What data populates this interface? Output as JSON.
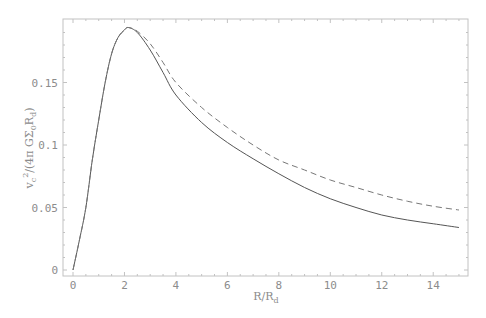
{
  "chart_data": {
    "type": "line",
    "title": "",
    "xlabel": "R/R_d",
    "ylabel": "v_c^2/(4π GΣ_0 R_d)",
    "xlim": [
      0,
      15
    ],
    "ylim": [
      0,
      0.197
    ],
    "x_ticks": [
      0,
      2,
      4,
      6,
      8,
      10,
      12,
      14
    ],
    "x_tick_labels": [
      "0",
      "2",
      "4",
      "6",
      "8",
      "10",
      "12",
      "14"
    ],
    "y_ticks": [
      0,
      0.05,
      0.1,
      0.15
    ],
    "y_tick_labels": [
      "0",
      "0.05",
      "0.1",
      "0.15"
    ],
    "grid": false,
    "legend": null,
    "series": [
      {
        "name": "solid",
        "style": "solid",
        "color": "#555555",
        "x": [
          0,
          0.25,
          0.5,
          0.75,
          1,
          1.25,
          1.5,
          1.75,
          2,
          2.15,
          2.5,
          3,
          3.5,
          4,
          5,
          6,
          7,
          8,
          9,
          10,
          11,
          12,
          13,
          14,
          15
        ],
        "y": [
          0,
          0.024,
          0.05,
          0.088,
          0.12,
          0.15,
          0.173,
          0.186,
          0.192,
          0.194,
          0.19,
          0.176,
          0.158,
          0.14,
          0.118,
          0.102,
          0.089,
          0.077,
          0.066,
          0.057,
          0.05,
          0.044,
          0.04,
          0.037,
          0.034
        ]
      },
      {
        "name": "dashed",
        "style": "dashed",
        "color": "#777777",
        "x": [
          0,
          0.25,
          0.5,
          0.75,
          1,
          1.25,
          1.5,
          1.75,
          2,
          2.15,
          2.5,
          3,
          3.5,
          4,
          5,
          6,
          7,
          8,
          9,
          10,
          11,
          12,
          13,
          14,
          15
        ],
        "y": [
          0,
          0.024,
          0.05,
          0.088,
          0.12,
          0.15,
          0.173,
          0.186,
          0.192,
          0.194,
          0.191,
          0.181,
          0.166,
          0.15,
          0.13,
          0.114,
          0.1,
          0.088,
          0.08,
          0.072,
          0.066,
          0.06,
          0.055,
          0.051,
          0.048
        ]
      }
    ]
  },
  "labels": {
    "x_axis": "R/R",
    "x_axis_sub": "d",
    "y_axis_v": "v",
    "y_axis_c": "c",
    "y_axis_sup": "2",
    "y_axis_mid": "/(4π GΣ",
    "y_axis_zero": "0",
    "y_axis_R": "R",
    "y_axis_d": "d",
    "y_axis_close": ")"
  },
  "colors": {
    "frame": "#b8b8b8",
    "text": "#8c8c8c",
    "solid_line": "#555555",
    "dashed_line": "#777777"
  }
}
